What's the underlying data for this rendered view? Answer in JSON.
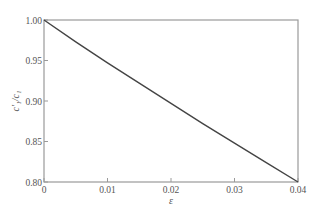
{
  "chart_data": {
    "type": "line",
    "title": "",
    "xlabel": "ε",
    "ylabel": "c'₁/c₁",
    "xlim": [
      0,
      0.04
    ],
    "ylim": [
      0.8,
      1.0
    ],
    "grid": false,
    "legend": null,
    "x_ticks": [
      "0",
      "0.01",
      "0.02",
      "0.03",
      "0.04"
    ],
    "y_ticks": [
      "0.80",
      "0.85",
      "0.90",
      "0.95",
      "1.00"
    ],
    "series": [
      {
        "name": "c'1/c1",
        "color": "#444444",
        "x": [
          0,
          0.005,
          0.01,
          0.015,
          0.02,
          0.025,
          0.03,
          0.035,
          0.04
        ],
        "values": [
          1.0,
          0.973,
          0.947,
          0.922,
          0.897,
          0.872,
          0.848,
          0.824,
          0.8
        ]
      }
    ]
  },
  "colors": {
    "frame": "#9a9a9a",
    "curve": "#444444",
    "text": "#555555"
  }
}
